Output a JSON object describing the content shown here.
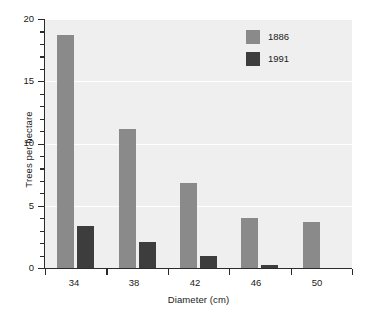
{
  "chart_data": {
    "type": "bar",
    "title": "",
    "xlabel": "Diameter (cm)",
    "ylabel": "Trees per hectare",
    "categories": [
      "34",
      "38",
      "42",
      "46",
      "50"
    ],
    "series": [
      {
        "name": "1886",
        "color": "#8a8a8a",
        "values": [
          18.7,
          11.2,
          6.8,
          4.0,
          3.7
        ]
      },
      {
        "name": "1991",
        "color": "#3d3d3d",
        "values": [
          3.4,
          2.1,
          1.0,
          0.25,
          0
        ]
      }
    ],
    "ylim": [
      0,
      20
    ],
    "ytick_labels": [
      "0",
      "5",
      "10",
      "15",
      "20"
    ],
    "ytick_values": [
      0,
      5,
      10,
      15,
      20
    ],
    "yminor_values": [
      1,
      2,
      3,
      4,
      6,
      7,
      8,
      9,
      11,
      12,
      13,
      14,
      16,
      17,
      18,
      19
    ],
    "grid": "horizontal-white",
    "legend_position": "top-right",
    "plot_background": "#efefef"
  },
  "axes": {
    "y_title": "Trees per hectare",
    "x_title": "Diameter (cm)",
    "y_labels": {
      "t0": "0",
      "t1": "5",
      "t2": "10",
      "t3": "15",
      "t4": "20"
    },
    "x_labels": {
      "c0": "34",
      "c1": "38",
      "c2": "42",
      "c3": "46",
      "c4": "50"
    }
  },
  "legend": {
    "items": [
      {
        "label": "1886",
        "color": "#8a8a8a"
      },
      {
        "label": "1991",
        "color": "#3d3d3d"
      }
    ]
  }
}
